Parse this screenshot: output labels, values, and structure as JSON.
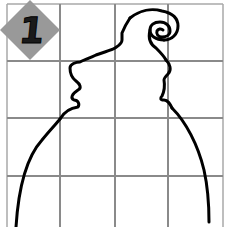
{
  "puzzle": {
    "number": "1",
    "grid": {
      "columns": 4,
      "rows": 4,
      "line_color": "#8a8a8a",
      "border_color": "#b0b0b0"
    },
    "badge": {
      "shape": "diamond",
      "fill": "#999999",
      "text_color": "#1a1a1a"
    },
    "drawing": {
      "stroke": "#000000",
      "description": "partial outline of a bearded face / gnome hat with spiral curl, to be completed"
    }
  }
}
